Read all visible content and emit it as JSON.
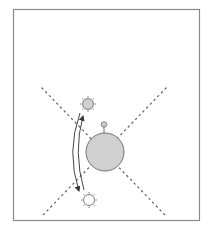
{
  "diagram": {
    "title": "",
    "colors": {
      "frame": "#8a8a8a",
      "planet_fill": "#d0d0d0",
      "planet_stroke": "#707070",
      "sun_upper_fill": "#cfcfcf",
      "sun_lower_fill": "#ffffff",
      "line": "#555555",
      "dots": "#666666"
    },
    "elements": {
      "planet": {
        "label": ""
      },
      "observer": {
        "label": ""
      },
      "sun_upper": {
        "label": ""
      },
      "sun_lower": {
        "label": ""
      }
    }
  }
}
